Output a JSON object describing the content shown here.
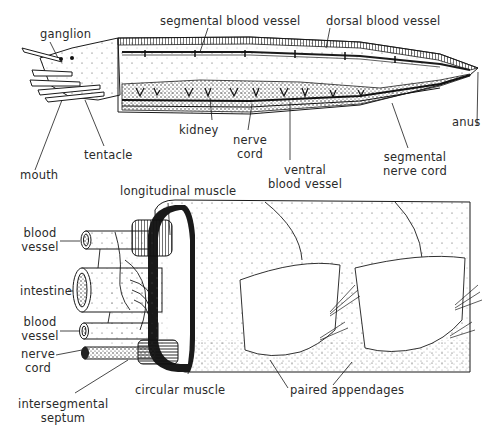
{
  "figure": {
    "top_panel": {
      "title": "whole worm, lateral view",
      "labels": {
        "ganglion": "ganglion",
        "segmental_blood_vessel": "segmental blood vessel",
        "dorsal_blood_vessel": "dorsal blood vessel",
        "kidney": "kidney",
        "nerve_cord_1": "nerve",
        "nerve_cord_2": "cord",
        "ventral_bv_1": "ventral",
        "ventral_bv_2": "blood vessel",
        "segmental_nerve_1": "segmental",
        "segmental_nerve_2": "nerve cord",
        "anus": "anus",
        "mouth": "mouth",
        "tentacle": "tentacle"
      }
    },
    "bottom_panel": {
      "title": "body segment cutaway",
      "labels": {
        "longitudinal_muscle": "longitudinal muscle",
        "blood_vessel_top_1": "blood",
        "blood_vessel_top_2": "vessel",
        "intestine": "intestine",
        "blood_vessel_bottom_1": "blood",
        "blood_vessel_bottom_2": "vessel",
        "nerve_cord_1": "nerve",
        "nerve_cord_2": "cord",
        "circular_muscle": "circular muscle",
        "paired_appendages": "paired appendages",
        "intersegmental_1": "intersegmental",
        "intersegmental_2": "septum"
      }
    },
    "colors": {
      "ink": "#1a1a1a",
      "label": "#2a2a2a",
      "background": "#ffffff"
    }
  }
}
